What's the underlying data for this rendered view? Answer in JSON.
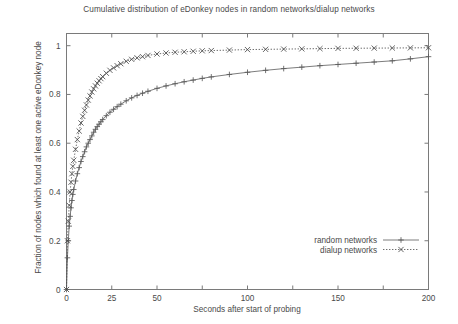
{
  "chart_data": {
    "type": "line",
    "title": "Cumulative distribution of eDonkey nodes in random networks/dialup networks",
    "xlabel": "Seconds after start of probing",
    "ylabel": "Fraction of nodes which found at least one active eDonkey node",
    "xlim": [
      0,
      200
    ],
    "ylim": [
      0,
      1.05
    ],
    "grid": false,
    "legend_position": "bottom-right",
    "x_ticks": [
      0,
      25,
      50,
      75,
      100,
      125,
      150,
      175,
      200
    ],
    "x_tick_labels": [
      "0",
      "25",
      "50",
      "",
      "100",
      "",
      "150",
      "",
      "200"
    ],
    "y_ticks": [
      0,
      0.2,
      0.4,
      0.6,
      0.8,
      1
    ],
    "y_tick_labels": [
      "0",
      "0.2",
      "0.4",
      "0.6",
      "0.8",
      "1"
    ],
    "series": [
      {
        "name": "random networks",
        "marker": "plus",
        "linestyle": "solid",
        "color": "#5a5a5a",
        "x": [
          0,
          0.5,
          1,
          1.5,
          2,
          2.5,
          3,
          3.5,
          4,
          5,
          6,
          7,
          8,
          9,
          10,
          11,
          12,
          13,
          14,
          15,
          16,
          17,
          18,
          19,
          20,
          22,
          24,
          26,
          28,
          30,
          33,
          36,
          39,
          42,
          45,
          50,
          55,
          60,
          65,
          70,
          75,
          80,
          90,
          100,
          110,
          120,
          130,
          140,
          150,
          160,
          170,
          180,
          190,
          200
        ],
        "y": [
          0,
          0.13,
          0.2,
          0.26,
          0.3,
          0.335,
          0.365,
          0.39,
          0.41,
          0.445,
          0.475,
          0.5,
          0.525,
          0.545,
          0.565,
          0.585,
          0.6,
          0.615,
          0.63,
          0.645,
          0.657,
          0.668,
          0.678,
          0.688,
          0.697,
          0.713,
          0.727,
          0.739,
          0.75,
          0.76,
          0.774,
          0.786,
          0.796,
          0.805,
          0.813,
          0.825,
          0.835,
          0.844,
          0.852,
          0.859,
          0.866,
          0.872,
          0.882,
          0.891,
          0.899,
          0.906,
          0.912,
          0.918,
          0.923,
          0.928,
          0.933,
          0.938,
          0.946,
          0.955
        ]
      },
      {
        "name": "dialup networks",
        "marker": "cross",
        "linestyle": "dotted",
        "color": "#4a4a4a",
        "x": [
          0,
          0.5,
          1,
          1.5,
          2,
          2.5,
          3,
          3.5,
          4,
          5,
          6,
          7,
          8,
          9,
          10,
          11,
          12,
          13,
          14,
          15,
          16,
          17,
          18,
          19,
          20,
          22,
          24,
          26,
          28,
          30,
          33,
          36,
          39,
          42,
          45,
          50,
          55,
          60,
          65,
          70,
          75,
          80,
          90,
          100,
          110,
          120,
          130,
          140,
          150,
          160,
          170,
          180,
          190,
          200
        ],
        "y": [
          0,
          0.2,
          0.28,
          0.345,
          0.4,
          0.44,
          0.475,
          0.505,
          0.53,
          0.575,
          0.615,
          0.65,
          0.683,
          0.71,
          0.735,
          0.757,
          0.777,
          0.794,
          0.81,
          0.823,
          0.835,
          0.846,
          0.856,
          0.865,
          0.873,
          0.887,
          0.899,
          0.909,
          0.918,
          0.926,
          0.936,
          0.944,
          0.95,
          0.955,
          0.96,
          0.966,
          0.97,
          0.973,
          0.975,
          0.977,
          0.979,
          0.98,
          0.982,
          0.984,
          0.985,
          0.986,
          0.987,
          0.988,
          0.989,
          0.9895,
          0.99,
          0.9905,
          0.991,
          0.9915
        ]
      }
    ]
  },
  "legend": {
    "entries": [
      {
        "label": "random networks"
      },
      {
        "label": "dialup networks"
      }
    ]
  }
}
